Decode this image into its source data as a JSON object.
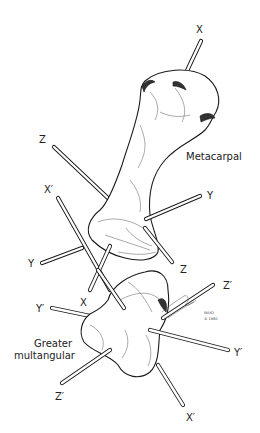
{
  "figure": {
    "type": "anatomical line illustration",
    "colors": {
      "ink": "#1a1a1a",
      "background": "#ffffff"
    }
  },
  "bones": {
    "metacarpal": {
      "label": "Metacarpal"
    },
    "greater_multangular": {
      "label_line1": "Greater",
      "label_line2": "multangular"
    }
  },
  "axis_labels": {
    "x_top": "X",
    "z_upper_left": "Z",
    "x_prime_left": "X′",
    "y_upper_right": "Y",
    "y_left": "Y",
    "z_mid_right": "Z",
    "x_mid": "X",
    "z_prime_right": "Z′",
    "y_prime_left": "Y′",
    "y_prime_right": "Y′",
    "z_prime_bottom": "Z′",
    "x_prime_bottom": "X′"
  },
  "signature": {
    "line1": "MAYO",
    "line2": "© 1980"
  }
}
